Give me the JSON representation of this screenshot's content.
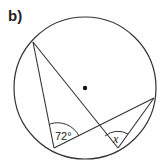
{
  "part_label": "b)",
  "angles": {
    "known": "72°",
    "unknown": "x"
  },
  "colors": {
    "stroke": "#222222",
    "background": "#ffffff"
  }
}
